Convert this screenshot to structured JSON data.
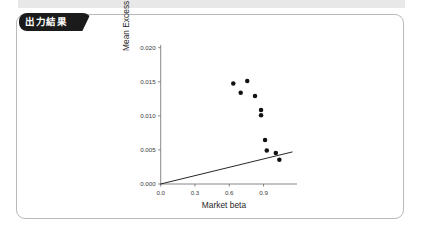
{
  "window": {
    "top_band_color": "#e8e8e8",
    "card_border_color": "#b9b9b9",
    "background": "#ffffff"
  },
  "card": {
    "tab_label": "出力結果",
    "tab_background": "#1b1b1b",
    "tab_text_color": "#ffffff"
  },
  "chart_data": {
    "type": "scatter",
    "title": "",
    "xlabel": "Market beta",
    "ylabel": "Mean Excess Return",
    "xlim": [
      0.0,
      1.2
    ],
    "ylim": [
      0.0,
      0.0205
    ],
    "xticks": [
      0.0,
      0.3,
      0.6,
      0.9
    ],
    "xticklabels": [
      "0.0",
      "0.3",
      "0.6",
      "0.9"
    ],
    "yticks": [
      0.0,
      0.005,
      0.01,
      0.015,
      0.02
    ],
    "yticklabels": [
      "0.000",
      "0.005",
      "0.010",
      "0.015",
      "0.020"
    ],
    "grid": false,
    "legend": null,
    "marker_color": "#111111",
    "marker_size": 3.4,
    "points": [
      {
        "x": 0.635,
        "y": 0.01475
      },
      {
        "x": 0.757,
        "y": 0.01512
      },
      {
        "x": 0.7,
        "y": 0.0134
      },
      {
        "x": 0.825,
        "y": 0.0129
      },
      {
        "x": 0.878,
        "y": 0.01085
      },
      {
        "x": 0.878,
        "y": 0.0101
      },
      {
        "x": 0.913,
        "y": 0.00645
      },
      {
        "x": 0.928,
        "y": 0.0049
      },
      {
        "x": 1.007,
        "y": 0.00455
      },
      {
        "x": 1.038,
        "y": 0.00355
      }
    ],
    "fit_line": {
      "kind": "linear",
      "color": "#1a1a1a",
      "x_start": 0.0,
      "y_start": 0.0,
      "x_end": 1.15,
      "y_end": 0.0047
    }
  }
}
